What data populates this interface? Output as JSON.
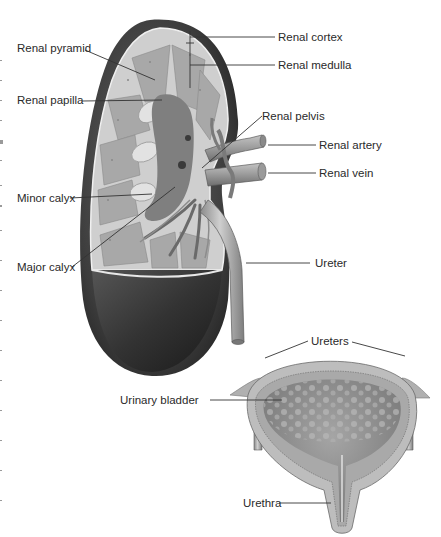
{
  "figure": {
    "colors": {
      "capsule": "#3a3a3a",
      "cortex": "#cfcfcf",
      "medulla": "#a8a8a8",
      "pelvis": "#7a7a7a",
      "vessel": "#9a9a9a",
      "bladder_wall": "#b5b5b5",
      "bladder_lumen": "#8f8f8f",
      "label_text": "#2a2a2a",
      "leader_line": "#333333"
    }
  },
  "labels": {
    "renal_pyramid": "Renal pyramid",
    "renal_papilla": "Renal papilla",
    "minor_calyx": "Minor calyx",
    "major_calyx": "Major calyx",
    "renal_cortex": "Renal cortex",
    "renal_medulla": "Renal medulla",
    "renal_pelvis": "Renal pelvis",
    "renal_artery": "Renal artery",
    "renal_vein": "Renal vein",
    "ureter": "Ureter",
    "ureters": "Ureters",
    "urinary_bladder": "Urinary bladder",
    "urethra": "Urethra"
  }
}
